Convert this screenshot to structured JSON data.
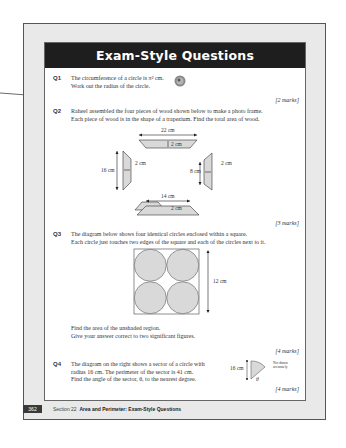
{
  "page": {
    "title": "Exam-Style Questions",
    "footer": {
      "page_number": "362",
      "section_label": "Section 22",
      "section_title": "Area and Perimeter: Exam-Style Questions"
    }
  },
  "questions": [
    {
      "number": "Q1",
      "lines": [
        "The circumference of a circle is π² cm.",
        "Work out the radius of the circle."
      ],
      "icon": "calculator-icon",
      "marks": "[2 marks]"
    },
    {
      "number": "Q2",
      "lines": [
        "Raheel assembled the four pieces of wood shown below to make a photo frame.",
        "Each piece of wood is in the shape of a trapezium.  Find the total area of wood."
      ],
      "diagram_labels": {
        "top_width": "22 cm",
        "top_height": "2 cm",
        "left_height": "16 cm",
        "left_width": "2 cm",
        "right_height": "8 cm",
        "right_width": "2 cm",
        "bottom_width": "14 cm",
        "bottom_height": "2 cm"
      },
      "marks": "[3 marks]"
    },
    {
      "number": "Q3",
      "lines": [
        "The diagram below shows four identical circles enclosed within a square.",
        "Each circle just touches two edges of the square and each of the circles next to it."
      ],
      "diagram_labels": {
        "side": "12 cm"
      },
      "follow_up": [
        "Find the area of the unshaded region.",
        "Give your answer correct to two significant figures."
      ],
      "marks": "[4 marks]"
    },
    {
      "number": "Q4",
      "lines": [
        "The diagram on the right shows a sector of a circle with",
        "radius 16 cm.  The perimeter of the sector is 41 cm.",
        "Find the angle of the sector, θ, to the nearest degree."
      ],
      "diagram_labels": {
        "radius": "16 cm",
        "angle": "θ",
        "note_1": "Not drawn",
        "note_2": "accurately"
      },
      "marks": "[4 marks]"
    }
  ],
  "colors": {
    "title_bar": "#1e1e1e",
    "page_bg": "#e9e9e9",
    "shape_fill": "#d9d9d9"
  }
}
